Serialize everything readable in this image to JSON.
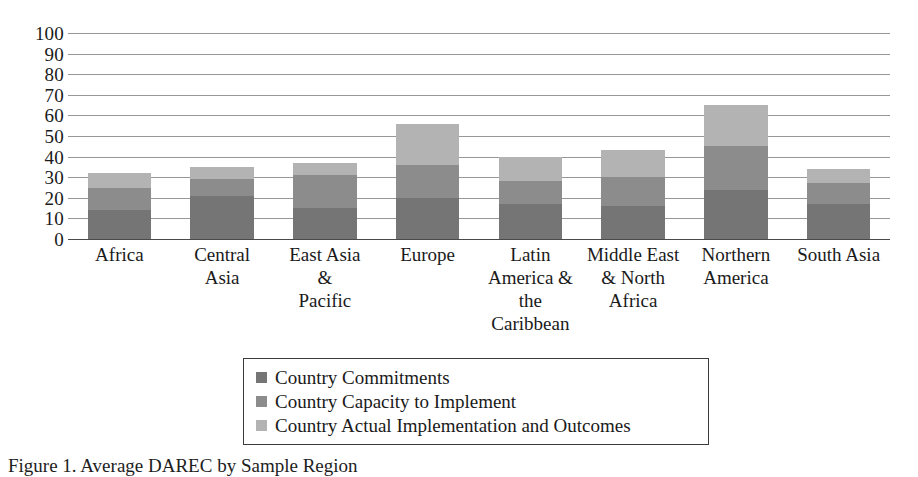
{
  "chart_data": {
    "type": "bar",
    "subtype": "stacked-bar",
    "title": "",
    "xlabel": "",
    "ylabel": "",
    "ylim": [
      0,
      100
    ],
    "yticks": [
      0,
      10,
      20,
      30,
      40,
      50,
      60,
      70,
      80,
      90,
      100
    ],
    "grid": true,
    "legend_position": "bottom-center",
    "categories": [
      "Africa",
      "Central\nAsia",
      "East Asia\n&\nPacific",
      "Europe",
      "Latin\nAmerica &\nthe\nCaribbean",
      "Middle East\n& North\nAfrica",
      "Northern\nAmerica",
      "South Asia"
    ],
    "series": [
      {
        "name": "Country Commitments",
        "color": "#757575",
        "values": [
          14,
          21,
          15,
          20,
          17,
          16,
          24,
          17
        ]
      },
      {
        "name": "Country Capacity to Implement",
        "color": "#8c8c8c",
        "values": [
          11,
          8,
          16,
          16,
          11,
          14,
          21,
          10
        ]
      },
      {
        "name": "Country Actual Implementation and Outcomes",
        "color": "#b3b3b3",
        "values": [
          7,
          6,
          6,
          20,
          12,
          13,
          20,
          7
        ]
      }
    ],
    "totals": [
      32,
      35,
      37,
      56,
      40,
      43,
      65,
      34
    ]
  },
  "axis": {
    "y_tick_labels": [
      "100",
      "90",
      "80",
      "70",
      "60",
      "50",
      "40",
      "30",
      "20",
      "10",
      "0"
    ]
  },
  "legend": {
    "items": [
      {
        "label": "Country Commitments",
        "color": "#757575",
        "swatch": "legend-swatch-dark"
      },
      {
        "label": "Country Capacity to Implement",
        "color": "#8c8c8c",
        "swatch": "legend-swatch-medium"
      },
      {
        "label": "Country Actual Implementation and Outcomes",
        "color": "#b3b3b3",
        "swatch": "legend-swatch-light"
      }
    ]
  },
  "caption": {
    "text": "Figure 1. Average DAREC by Sample Region"
  }
}
